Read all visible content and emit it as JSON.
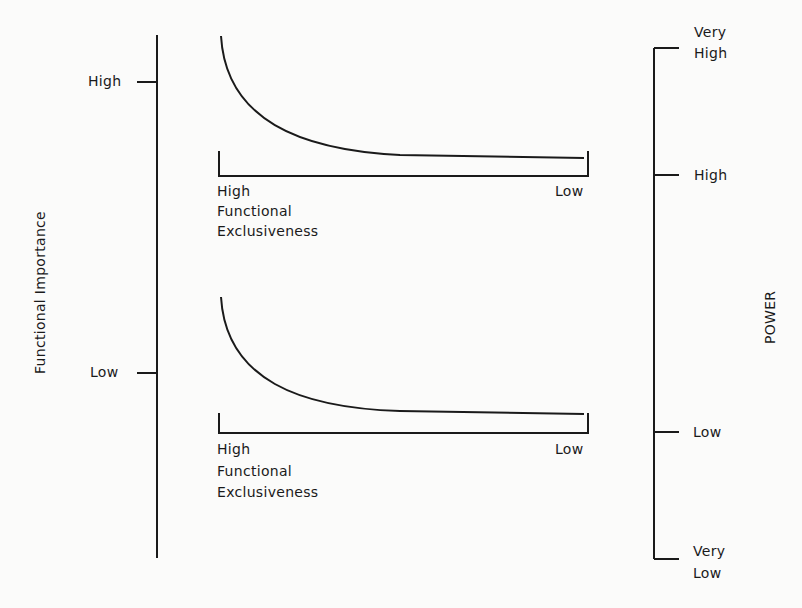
{
  "left_axis": {
    "title": "Functional Importance",
    "ticks": [
      {
        "label": "High",
        "y": 82
      },
      {
        "label": "Low",
        "y": 373
      }
    ]
  },
  "right_axis": {
    "title": "POWER",
    "ticks": [
      {
        "label_line1": "Very",
        "label_line2": "High"
      },
      {
        "label_line1": "High"
      },
      {
        "label_line1": "Low"
      },
      {
        "label_line1": "Very",
        "label_line2": "Low"
      }
    ]
  },
  "panels": [
    {
      "name": "high-importance",
      "x_left_label": "High",
      "x_right_label": "Low",
      "x_title_line1": "Functional",
      "x_title_line2": "Exclusiveness",
      "power_range": "Very High to High"
    },
    {
      "name": "low-importance",
      "x_left_label": "High",
      "x_right_label": "Low",
      "x_title_line1": "Functional",
      "x_title_line2": "Exclusiveness",
      "power_range": "Low to Very Low"
    }
  ],
  "colors": {
    "ink": "#1a1a1a",
    "background": "#fbfbfa"
  }
}
